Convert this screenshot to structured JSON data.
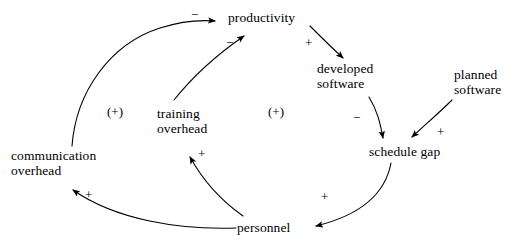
{
  "diagram": {
    "type": "causal-loop-diagram",
    "title": "",
    "background_color": "#ffffff",
    "stroke_color": "#000000",
    "width": 524,
    "height": 243,
    "nodes": [
      {
        "id": "productivity",
        "label": "productivity",
        "x": 228,
        "y": 10,
        "align": "left"
      },
      {
        "id": "developed-software",
        "label": "developed\nsoftware",
        "x": 317,
        "y": 61,
        "align": "left"
      },
      {
        "id": "planned-software",
        "label": "planned\nsoftware",
        "x": 454,
        "y": 67,
        "align": "left"
      },
      {
        "id": "schedule-gap",
        "label": "schedule gap",
        "x": 369,
        "y": 144,
        "align": "left"
      },
      {
        "id": "personnel",
        "label": "personnel",
        "x": 237,
        "y": 220,
        "align": "left"
      },
      {
        "id": "communication-overhead",
        "label": "communication\noverhead",
        "x": 11,
        "y": 148,
        "align": "left"
      },
      {
        "id": "training-overhead",
        "label": "training\noverhead",
        "x": 157,
        "y": 106,
        "align": "left"
      }
    ],
    "links": [
      {
        "id": "communication-overhead-to-productivity",
        "from": "communication overhead",
        "to": "productivity",
        "sign": "−"
      },
      {
        "id": "training-overhead-to-productivity",
        "from": "training overhead",
        "to": "productivity",
        "sign": "−"
      },
      {
        "id": "productivity-to-developed-software",
        "from": "productivity",
        "to": "developed software",
        "sign": "+"
      },
      {
        "id": "developed-software-to-schedule-gap",
        "from": "developed software",
        "to": "schedule gap",
        "sign": "−"
      },
      {
        "id": "planned-software-to-schedule-gap",
        "from": "planned software",
        "to": "schedule gap",
        "sign": "+"
      },
      {
        "id": "schedule-gap-to-personnel",
        "from": "schedule gap",
        "to": "personnel",
        "sign": "+"
      },
      {
        "id": "personnel-to-training-overhead",
        "from": "personnel",
        "to": "training overhead",
        "sign": "+"
      },
      {
        "id": "personnel-to-communication-overhead",
        "from": "personnel",
        "to": "communication overhead",
        "sign": "+"
      }
    ],
    "sign_markers": [
      {
        "id": "sign-comm-productivity",
        "text": "−",
        "x": 191,
        "y": 8
      },
      {
        "id": "sign-training-productivity",
        "text": "−",
        "x": 226,
        "y": 36
      },
      {
        "id": "sign-productivity-developed",
        "text": "+",
        "x": 305,
        "y": 36
      },
      {
        "id": "sign-developed-schedule",
        "text": "−",
        "x": 353,
        "y": 111
      },
      {
        "id": "sign-planned-schedule",
        "text": "+",
        "x": 437,
        "y": 125
      },
      {
        "id": "sign-schedule-personnel",
        "text": "+",
        "x": 321,
        "y": 190
      },
      {
        "id": "sign-personnel-training",
        "text": "+",
        "x": 198,
        "y": 147
      },
      {
        "id": "sign-personnel-comm",
        "text": "+",
        "x": 85,
        "y": 188
      }
    ],
    "loop_markers": [
      {
        "id": "loop-marker-left",
        "text": "(+)",
        "x": 107,
        "y": 105
      },
      {
        "id": "loop-marker-right",
        "text": "(+)",
        "x": 268,
        "y": 105
      }
    ]
  }
}
